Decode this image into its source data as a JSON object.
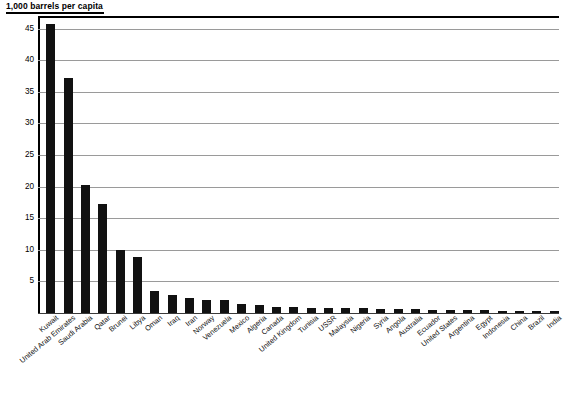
{
  "chart": {
    "title": "1,000 barrels per capita",
    "axis_title_rule_color": "#000000",
    "bar_color": "#111111",
    "gridline_color": "#9a9a9a",
    "axis_color": "#000000"
  },
  "chart_data": {
    "type": "bar",
    "title": "1,000 barrels per capita",
    "xlabel": "",
    "ylabel": "1,000 barrels per capita",
    "ylim": [
      0,
      47
    ],
    "yticks": [
      5,
      10,
      15,
      20,
      25,
      30,
      35,
      40,
      45
    ],
    "grid": true,
    "legend": "none",
    "orientation": "vertical",
    "categories": [
      "Kuwait",
      "United Arab Emirates",
      "Saudi Arabia",
      "Qatar",
      "Brunei",
      "Libya",
      "Oman",
      "Iraq",
      "Iran",
      "Norway",
      "Venezuela",
      "Mexico",
      "Algeria",
      "Canada",
      "United Kingdom",
      "Tunisia",
      "USSR",
      "Malaysia",
      "Nigeria",
      "Syria",
      "Angola",
      "Australia",
      "Ecuador",
      "United States",
      "Argentina",
      "Egypt",
      "Indonesia",
      "China",
      "Brazil",
      "India"
    ],
    "values": [
      45.7,
      37.2,
      20.3,
      17.2,
      9.9,
      8.8,
      3.5,
      2.9,
      2.4,
      2.1,
      2.0,
      1.4,
      1.2,
      1.0,
      0.9,
      0.85,
      0.8,
      0.8,
      0.75,
      0.7,
      0.65,
      0.6,
      0.55,
      0.5,
      0.45,
      0.4,
      0.35,
      0.3,
      0.25,
      0.15
    ]
  }
}
